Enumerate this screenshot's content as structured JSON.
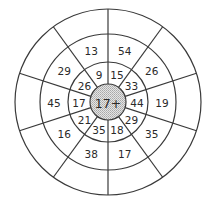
{
  "diagram": {
    "type": "target-number-wheel",
    "center_label": "17+",
    "colors": {
      "line": "#3a3a3a",
      "center_fill": "#c9c9c9",
      "background": "#ffffff"
    },
    "geometry": {
      "cx": 108,
      "cy": 102,
      "radii": {
        "center": 18,
        "inner": 40,
        "middle": 68,
        "outer": 93
      },
      "segments": 10,
      "start_angle_deg": 90,
      "step_deg": 36
    },
    "rings": {
      "inner": [
        "15",
        "33",
        "44",
        "29",
        "18",
        "35",
        "21",
        "17",
        "26",
        "9"
      ],
      "middle": [
        "54",
        "26",
        "19",
        "35",
        "17",
        "38",
        "16",
        "45",
        "29",
        "13"
      ],
      "outer": [
        "",
        "",
        "",
        "",
        "",
        "",
        "",
        "",
        "",
        ""
      ]
    }
  }
}
